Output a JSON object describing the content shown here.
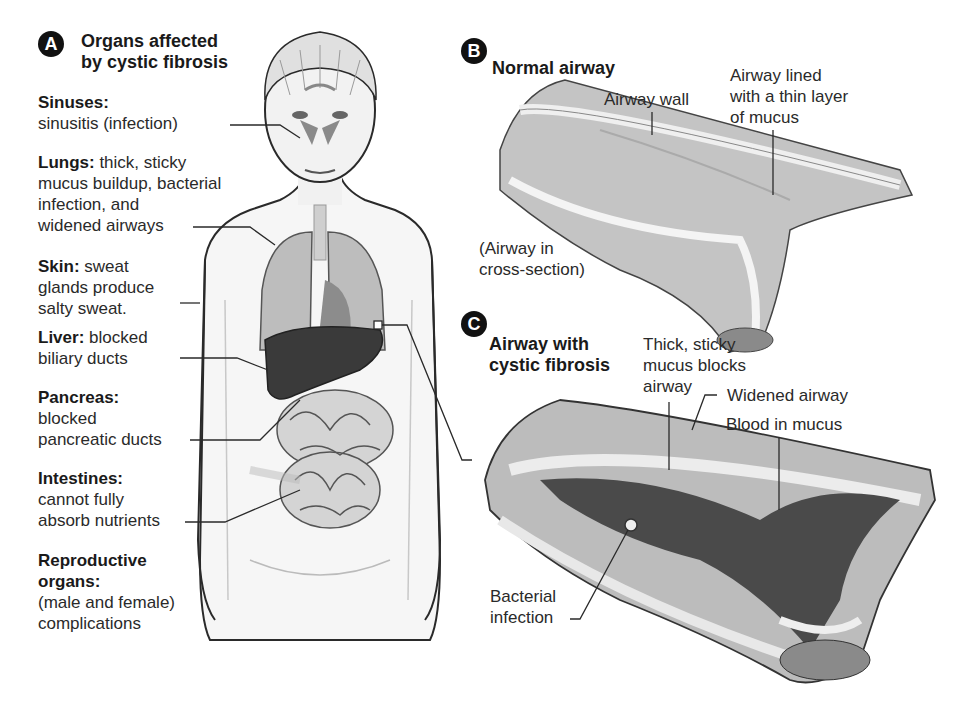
{
  "panel_a": {
    "badge": "A",
    "title_line1": "Organs affected",
    "title_line2": "by cystic fibrosis",
    "organs": [
      {
        "name": "Sinuses:",
        "desc": [
          "sinusitis (infection)"
        ]
      },
      {
        "name": "Lungs:",
        "desc": [
          "thick, sticky",
          "mucus buildup, bacterial",
          "infection, and",
          "widened airways"
        ]
      },
      {
        "name": "Skin:",
        "desc": [
          "sweat",
          "glands produce",
          "salty sweat."
        ]
      },
      {
        "name": "Liver:",
        "desc": [
          "blocked",
          "biliary ducts"
        ]
      },
      {
        "name": "Pancreas:",
        "desc": [
          "blocked",
          "pancreatic ducts"
        ]
      },
      {
        "name": "Intestines:",
        "desc": [
          "cannot fully",
          "absorb nutrients"
        ]
      },
      {
        "name": "Reproductive organs:",
        "desc": [
          "(male and female)",
          "complications"
        ]
      }
    ]
  },
  "panel_b": {
    "badge": "B",
    "title": "Normal airway",
    "labels": {
      "airway_wall": "Airway wall",
      "lined_1": "Airway lined",
      "lined_2": "with a thin layer",
      "lined_3": "of mucus",
      "cross_1": "(Airway in",
      "cross_2": "cross-section)"
    }
  },
  "panel_c": {
    "badge": "C",
    "title_line1": "Airway with",
    "title_line2": "cystic fibrosis",
    "labels": {
      "thick_1": "Thick, sticky",
      "thick_2": "mucus blocks",
      "thick_3": "airway",
      "widened": "Widened airway",
      "blood": "Blood in mucus",
      "bact_1": "Bacterial",
      "bact_2": "infection"
    }
  },
  "colors": {
    "ink": "#1a1a1a",
    "panel_bg": "#efefef",
    "liver": "#3a3a3a",
    "tissue_light": "#d8d8d8",
    "tissue_mid": "#9a9a9a",
    "mucus_dark": "#4a4a4a"
  }
}
